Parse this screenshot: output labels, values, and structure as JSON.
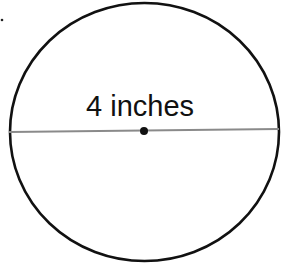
{
  "diagram": {
    "type": "circle-with-diameter",
    "label": "4 inches",
    "measurement": {
      "value": 4,
      "unit": "inches",
      "refers_to": "diameter"
    },
    "colors": {
      "circle_stroke": "#111111",
      "diameter_line": "#8a8a8a",
      "center_dot": "#111111",
      "background": "#ffffff"
    }
  }
}
